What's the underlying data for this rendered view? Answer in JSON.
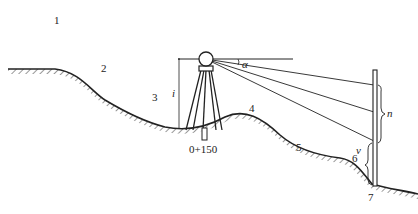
{
  "figure": {
    "type": "surveying cross-section diagram",
    "point_labels": [
      "1",
      "2",
      "3",
      "4",
      "5",
      "6",
      "7"
    ],
    "station_label": "0+150",
    "instrument_height_label": "i",
    "vertical_angle_label": "α",
    "staff_reading_label": "n",
    "staff_offset_label": "v",
    "colors": {
      "line": "#222222",
      "background": "#ffffff"
    }
  }
}
